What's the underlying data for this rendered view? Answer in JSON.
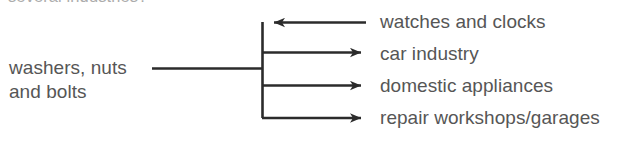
{
  "heading": {
    "clipped_text": "several industries?"
  },
  "source": {
    "line1": "washers, nuts",
    "line2": "and bolts"
  },
  "destinations": [
    {
      "label": "watches and clocks",
      "arrow_direction": "left"
    },
    {
      "label": "car industry",
      "arrow_direction": "right"
    },
    {
      "label": "domestic appliances",
      "arrow_direction": "right"
    },
    {
      "label": "repair workshops/garages",
      "arrow_direction": "right"
    }
  ],
  "colors": {
    "line": "#2b2b2b",
    "text": "#565656",
    "heading_text": "#8d8d8d",
    "background": "#ffffff"
  }
}
